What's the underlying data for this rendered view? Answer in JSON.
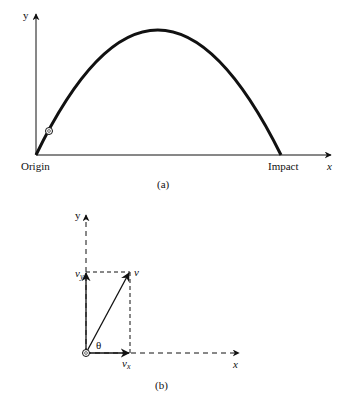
{
  "panel_a": {
    "caption": "(a)",
    "y_axis_label": "y",
    "x_axis_label": "x",
    "origin_label": "Origin",
    "impact_label": "Impact"
  },
  "panel_b": {
    "caption": "(b)",
    "y_axis_label": "y",
    "x_axis_label": "x",
    "v_label": "v",
    "vy_label": "v",
    "vy_sub": "y",
    "vx_label": "v",
    "vx_sub": "x",
    "theta_label": "θ"
  }
}
